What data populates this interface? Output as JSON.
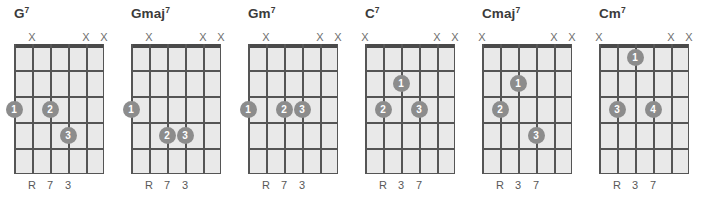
{
  "page": {
    "kind": "guitar-chord-chart",
    "background_color": "#ffffff",
    "line_color": "#555555",
    "board_fill": "#e9e9e9",
    "dot_color": "#8c8c8c",
    "dot_text_color": "#ffffff",
    "title_color": "#3b3b3b",
    "marker_color": "#6e6e6e",
    "label_color": "#585858",
    "string_count": 6,
    "fret_count": 5
  },
  "chart_data": {
    "type": "table",
    "columns": [
      "chord",
      "muted_strings",
      "fingering",
      "intervals"
    ],
    "chords": [
      {
        "name": "G",
        "quality": "7",
        "muted_strings": [
          2,
          5,
          6
        ],
        "open_strings": [],
        "dots": [
          {
            "finger": "1",
            "string": 1,
            "fret": 3
          },
          {
            "finger": "2",
            "string": 3,
            "fret": 3
          },
          {
            "finger": "3",
            "string": 4,
            "fret": 4
          }
        ],
        "interval_labels": [
          {
            "string": 2,
            "text": "R"
          },
          {
            "string": 3,
            "text": "7"
          },
          {
            "string": 4,
            "text": "3"
          }
        ]
      },
      {
        "name": "Gmaj",
        "quality": "7",
        "muted_strings": [
          2,
          5,
          6
        ],
        "open_strings": [],
        "dots": [
          {
            "finger": "1",
            "string": 1,
            "fret": 3
          },
          {
            "finger": "2",
            "string": 3,
            "fret": 4
          },
          {
            "finger": "3",
            "string": 4,
            "fret": 4
          }
        ],
        "interval_labels": [
          {
            "string": 2,
            "text": "R"
          },
          {
            "string": 3,
            "text": "7"
          },
          {
            "string": 4,
            "text": "3"
          }
        ]
      },
      {
        "name": "Gm",
        "quality": "7",
        "muted_strings": [
          2,
          5,
          6
        ],
        "open_strings": [],
        "dots": [
          {
            "finger": "1",
            "string": 1,
            "fret": 3
          },
          {
            "finger": "2",
            "string": 3,
            "fret": 3
          },
          {
            "finger": "3",
            "string": 4,
            "fret": 3
          }
        ],
        "interval_labels": [
          {
            "string": 2,
            "text": "R"
          },
          {
            "string": 3,
            "text": "7"
          },
          {
            "string": 4,
            "text": "3"
          }
        ]
      },
      {
        "name": "C",
        "quality": "7",
        "muted_strings": [
          1,
          5,
          6
        ],
        "open_strings": [],
        "dots": [
          {
            "finger": "1",
            "string": 3,
            "fret": 2
          },
          {
            "finger": "2",
            "string": 2,
            "fret": 3
          },
          {
            "finger": "3",
            "string": 4,
            "fret": 3
          }
        ],
        "interval_labels": [
          {
            "string": 2,
            "text": "R"
          },
          {
            "string": 3,
            "text": "3"
          },
          {
            "string": 4,
            "text": "7"
          }
        ]
      },
      {
        "name": "Cmaj",
        "quality": "7",
        "muted_strings": [
          1,
          5,
          6
        ],
        "open_strings": [],
        "dots": [
          {
            "finger": "1",
            "string": 3,
            "fret": 2
          },
          {
            "finger": "2",
            "string": 2,
            "fret": 3
          },
          {
            "finger": "3",
            "string": 4,
            "fret": 4
          }
        ],
        "interval_labels": [
          {
            "string": 2,
            "text": "R"
          },
          {
            "string": 3,
            "text": "3"
          },
          {
            "string": 4,
            "text": "7"
          }
        ]
      },
      {
        "name": "Cm",
        "quality": "7",
        "muted_strings": [
          1,
          5,
          6
        ],
        "open_strings": [],
        "dots": [
          {
            "finger": "1",
            "string": 3,
            "fret": 1
          },
          {
            "finger": "3",
            "string": 2,
            "fret": 3
          },
          {
            "finger": "4",
            "string": 4,
            "fret": 3
          }
        ],
        "interval_labels": [
          {
            "string": 2,
            "text": "R"
          },
          {
            "string": 3,
            "text": "3"
          },
          {
            "string": 4,
            "text": "7"
          }
        ]
      }
    ],
    "mute_symbol": "X",
    "open_symbol": "O"
  }
}
